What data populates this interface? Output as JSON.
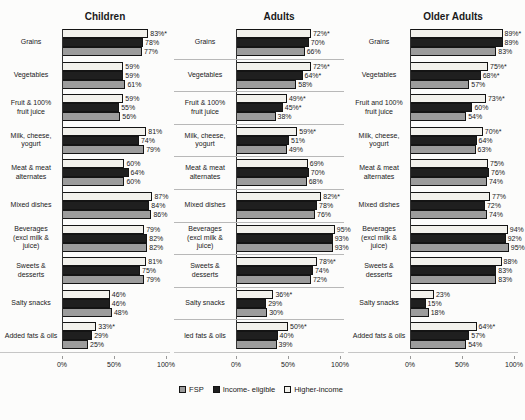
{
  "figure": {
    "legend": {
      "items": [
        {
          "id": "fsp",
          "label": "FSP"
        },
        {
          "id": "income-eligible",
          "label": "Income- eligible"
        },
        {
          "id": "higher-income",
          "label": "Higher-income"
        }
      ]
    },
    "colors": {
      "fsp": "#9c9c9c",
      "income-eligible": "#1f1f1f",
      "higher-income": "#f2f1ec",
      "bar_border": "#141414",
      "divider": "#b8b8b8",
      "axis": "#333333"
    }
  },
  "chart_data": {
    "type": "bar",
    "orientation": "horizontal",
    "note": "Three side-by-side horizontal grouped bar charts; bars in each group top-to-bottom are Higher-income (white), Income- eligible (black), FSP (gray); asterisks mark statistically flagged values",
    "x_axis": {
      "min": 0,
      "max": 100,
      "ticks": [
        "0%",
        "50%",
        "100%"
      ]
    },
    "series_top_to_bottom": [
      "Higher-income",
      "Income- eligible",
      "FSP"
    ],
    "panels": [
      {
        "title": "Children",
        "dividers": false,
        "groups": [
          {
            "label_lines": [
              "Grains"
            ],
            "bars": [
              {
                "series": "higher-income",
                "value": 83,
                "text": "83%*"
              },
              {
                "series": "income-eligible",
                "value": 78,
                "text": "78%"
              },
              {
                "series": "fsp",
                "value": 77,
                "text": "77%"
              }
            ]
          },
          {
            "label_lines": [
              "Vegetables"
            ],
            "bars": [
              {
                "series": "higher-income",
                "value": 59,
                "text": "59%"
              },
              {
                "series": "income-eligible",
                "value": 59,
                "text": "59%"
              },
              {
                "series": "fsp",
                "value": 61,
                "text": "61%"
              }
            ]
          },
          {
            "label_lines": [
              "Fruit & 100%",
              "fruit juice"
            ],
            "bars": [
              {
                "series": "higher-income",
                "value": 59,
                "text": "59%"
              },
              {
                "series": "income-eligible",
                "value": 55,
                "text": "55%"
              },
              {
                "series": "fsp",
                "value": 56,
                "text": "56%"
              }
            ]
          },
          {
            "label_lines": [
              "Milk, cheese,",
              "yogurt"
            ],
            "bars": [
              {
                "series": "higher-income",
                "value": 81,
                "text": "81%"
              },
              {
                "series": "income-eligible",
                "value": 74,
                "text": "74%"
              },
              {
                "series": "fsp",
                "value": 79,
                "text": "79%"
              }
            ]
          },
          {
            "label_lines": [
              "Meat & meat",
              "alternates"
            ],
            "bars": [
              {
                "series": "higher-income",
                "value": 60,
                "text": "60%"
              },
              {
                "series": "income-eligible",
                "value": 64,
                "text": "64%"
              },
              {
                "series": "fsp",
                "value": 60,
                "text": "60%"
              }
            ]
          },
          {
            "label_lines": [
              "Mixed dishes"
            ],
            "bars": [
              {
                "series": "higher-income",
                "value": 87,
                "text": "87%"
              },
              {
                "series": "income-eligible",
                "value": 84,
                "text": "84%"
              },
              {
                "series": "fsp",
                "value": 86,
                "text": "86%"
              }
            ]
          },
          {
            "label_lines": [
              "Beverages",
              "(excl milk &",
              "juice)"
            ],
            "bars": [
              {
                "series": "higher-income",
                "value": 79,
                "text": "79%"
              },
              {
                "series": "income-eligible",
                "value": 82,
                "text": "82%"
              },
              {
                "series": "fsp",
                "value": 82,
                "text": "82%"
              }
            ]
          },
          {
            "label_lines": [
              "Sweets &",
              "desserts"
            ],
            "bars": [
              {
                "series": "higher-income",
                "value": 81,
                "text": "81%"
              },
              {
                "series": "income-eligible",
                "value": 75,
                "text": "75%"
              },
              {
                "series": "fsp",
                "value": 79,
                "text": "79%"
              }
            ]
          },
          {
            "label_lines": [
              "Salty snacks"
            ],
            "bars": [
              {
                "series": "higher-income",
                "value": 46,
                "text": "46%"
              },
              {
                "series": "income-eligible",
                "value": 46,
                "text": "46%"
              },
              {
                "series": "fsp",
                "value": 48,
                "text": "48%"
              }
            ]
          },
          {
            "label_lines": [
              "Added fats & oils"
            ],
            "bars": [
              {
                "series": "higher-income",
                "value": 33,
                "text": "33%*"
              },
              {
                "series": "income-eligible",
                "value": 29,
                "text": "29%"
              },
              {
                "series": "fsp",
                "value": 25,
                "text": "25%"
              }
            ]
          }
        ]
      },
      {
        "title": "Adults",
        "dividers": true,
        "groups": [
          {
            "label_lines": [
              "Grains"
            ],
            "bars": [
              {
                "series": "higher-income",
                "value": 72,
                "text": "72%*"
              },
              {
                "series": "income-eligible",
                "value": 70,
                "text": "70%"
              },
              {
                "series": "fsp",
                "value": 66,
                "text": "66%"
              }
            ]
          },
          {
            "label_lines": [
              "Vegetables"
            ],
            "bars": [
              {
                "series": "higher-income",
                "value": 72,
                "text": "72%*"
              },
              {
                "series": "income-eligible",
                "value": 64,
                "text": "64%*"
              },
              {
                "series": "fsp",
                "value": 58,
                "text": "58%"
              }
            ]
          },
          {
            "label_lines": [
              "Fruit & 100%",
              "fruit juice"
            ],
            "bars": [
              {
                "series": "higher-income",
                "value": 49,
                "text": "49%*"
              },
              {
                "series": "income-eligible",
                "value": 45,
                "text": "45%*"
              },
              {
                "series": "fsp",
                "value": 38,
                "text": "38%"
              }
            ]
          },
          {
            "label_lines": [
              "Milk, cheese,",
              "yogurt"
            ],
            "bars": [
              {
                "series": "higher-income",
                "value": 59,
                "text": "59%*"
              },
              {
                "series": "income-eligible",
                "value": 51,
                "text": "51%"
              },
              {
                "series": "fsp",
                "value": 49,
                "text": "49%"
              }
            ]
          },
          {
            "label_lines": [
              "Meat & meat",
              "alternates"
            ],
            "bars": [
              {
                "series": "higher-income",
                "value": 69,
                "text": "69%"
              },
              {
                "series": "income-eligible",
                "value": 70,
                "text": "70%"
              },
              {
                "series": "fsp",
                "value": 68,
                "text": "68%"
              }
            ]
          },
          {
            "label_lines": [
              "Mixed dishes"
            ],
            "bars": [
              {
                "series": "higher-income",
                "value": 82,
                "text": "82%*"
              },
              {
                "series": "income-eligible",
                "value": 78,
                "text": "78%"
              },
              {
                "series": "fsp",
                "value": 76,
                "text": "76%"
              }
            ]
          },
          {
            "label_lines": [
              "Beverages",
              "(excl milk &",
              "juice)"
            ],
            "bars": [
              {
                "series": "higher-income",
                "value": 95,
                "text": "95%"
              },
              {
                "series": "income-eligible",
                "value": 93,
                "text": "93%"
              },
              {
                "series": "fsp",
                "value": 93,
                "text": "93%"
              }
            ]
          },
          {
            "label_lines": [
              "Sweets &",
              "desserts"
            ],
            "bars": [
              {
                "series": "higher-income",
                "value": 78,
                "text": "78%*"
              },
              {
                "series": "income-eligible",
                "value": 74,
                "text": "74%"
              },
              {
                "series": "fsp",
                "value": 72,
                "text": "72%"
              }
            ]
          },
          {
            "label_lines": [
              "Salty snacks"
            ],
            "bars": [
              {
                "series": "higher-income",
                "value": 36,
                "text": "36%*"
              },
              {
                "series": "income-eligible",
                "value": 29,
                "text": "29%"
              },
              {
                "series": "fsp",
                "value": 30,
                "text": "30%"
              }
            ]
          },
          {
            "label_lines": [
              "led fats & oils"
            ],
            "bars": [
              {
                "series": "higher-income",
                "value": 50,
                "text": "50%*"
              },
              {
                "series": "income-eligible",
                "value": 40,
                "text": "40%"
              },
              {
                "series": "fsp",
                "value": 39,
                "text": "39%"
              }
            ]
          }
        ]
      },
      {
        "title": "Older Adults",
        "dividers": false,
        "groups": [
          {
            "label_lines": [
              "Grains"
            ],
            "bars": [
              {
                "series": "higher-income",
                "value": 89,
                "text": "89%*"
              },
              {
                "series": "income-eligible",
                "value": 89,
                "text": "89%"
              },
              {
                "series": "fsp",
                "value": 83,
                "text": "83%"
              }
            ]
          },
          {
            "label_lines": [
              "Vegetables"
            ],
            "bars": [
              {
                "series": "higher-income",
                "value": 75,
                "text": "75%*"
              },
              {
                "series": "income-eligible",
                "value": 68,
                "text": "68%*"
              },
              {
                "series": "fsp",
                "value": 57,
                "text": "57%"
              }
            ]
          },
          {
            "label_lines": [
              "Fruit and 100%",
              "fruit juice"
            ],
            "bars": [
              {
                "series": "higher-income",
                "value": 73,
                "text": "73%*"
              },
              {
                "series": "income-eligible",
                "value": 60,
                "text": "60%"
              },
              {
                "series": "fsp",
                "value": 54,
                "text": "54%"
              }
            ]
          },
          {
            "label_lines": [
              "Milk, cheese,",
              "yogurt"
            ],
            "bars": [
              {
                "series": "higher-income",
                "value": 70,
                "text": "70%*"
              },
              {
                "series": "income-eligible",
                "value": 64,
                "text": "64%"
              },
              {
                "series": "fsp",
                "value": 63,
                "text": "63%"
              }
            ]
          },
          {
            "label_lines": [
              "Meat & meat",
              "alternates"
            ],
            "bars": [
              {
                "series": "higher-income",
                "value": 75,
                "text": "75%"
              },
              {
                "series": "income-eligible",
                "value": 76,
                "text": "76%"
              },
              {
                "series": "fsp",
                "value": 74,
                "text": "74%"
              }
            ]
          },
          {
            "label_lines": [
              "Mixed dishes"
            ],
            "bars": [
              {
                "series": "higher-income",
                "value": 77,
                "text": "77%"
              },
              {
                "series": "income-eligible",
                "value": 72,
                "text": "72%"
              },
              {
                "series": "fsp",
                "value": 74,
                "text": "74%"
              }
            ]
          },
          {
            "label_lines": [
              "Beverages",
              "(excl milk &",
              "juice)"
            ],
            "bars": [
              {
                "series": "higher-income",
                "value": 94,
                "text": "94%"
              },
              {
                "series": "income-eligible",
                "value": 92,
                "text": "92%"
              },
              {
                "series": "fsp",
                "value": 95,
                "text": "95%"
              }
            ]
          },
          {
            "label_lines": [
              "Sweets &",
              "desserts"
            ],
            "bars": [
              {
                "series": "higher-income",
                "value": 88,
                "text": "88%"
              },
              {
                "series": "income-eligible",
                "value": 83,
                "text": "83%"
              },
              {
                "series": "fsp",
                "value": 83,
                "text": "83%"
              }
            ]
          },
          {
            "label_lines": [
              "Salty snacks"
            ],
            "bars": [
              {
                "series": "higher-income",
                "value": 23,
                "text": "23%"
              },
              {
                "series": "income-eligible",
                "value": 15,
                "text": "15%"
              },
              {
                "series": "fsp",
                "value": 18,
                "text": "18%"
              }
            ]
          },
          {
            "label_lines": [
              "Added fats & oils"
            ],
            "bars": [
              {
                "series": "higher-income",
                "value": 64,
                "text": "64%*"
              },
              {
                "series": "income-eligible",
                "value": 57,
                "text": "57%"
              },
              {
                "series": "fsp",
                "value": 54,
                "text": "54%"
              }
            ]
          }
        ]
      }
    ]
  }
}
